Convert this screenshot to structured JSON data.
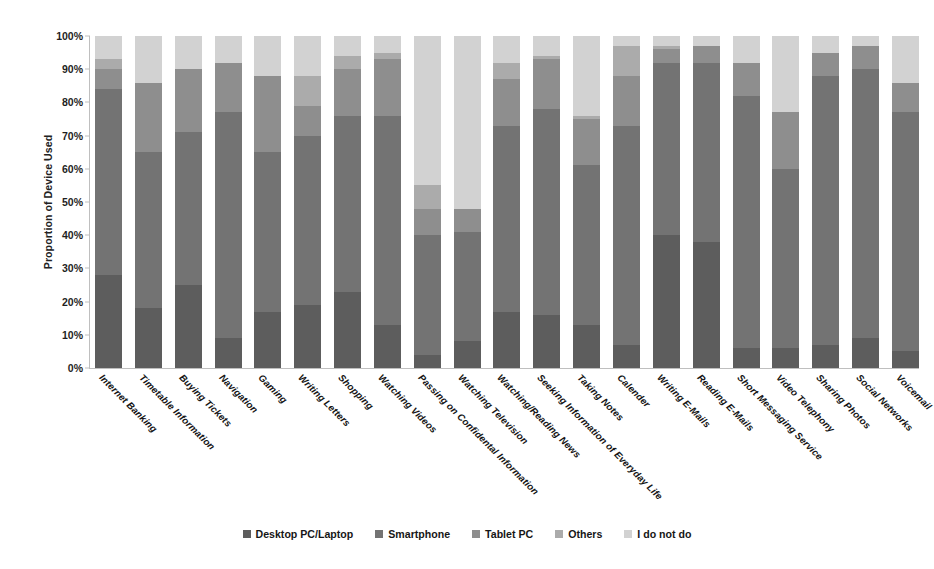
{
  "chart_data": {
    "type": "bar",
    "variant": "stacked-column-100",
    "title": "",
    "xlabel": "",
    "ylabel": "Proportion of Device Used",
    "ylim": [
      0,
      100
    ],
    "ytick_labels": [
      "0%",
      "10%",
      "20%",
      "30%",
      "40%",
      "50%",
      "60%",
      "70%",
      "80%",
      "90%",
      "100%"
    ],
    "ytick_values": [
      0,
      10,
      20,
      30,
      40,
      50,
      60,
      70,
      80,
      90,
      100
    ],
    "grid": false,
    "legend_position": "bottom",
    "categories": [
      "Internet Banking",
      "Timetable Information",
      "Buying Tickets",
      "Navigation",
      "Gaming",
      "Writing Letters",
      "Shopping",
      "Watching Videos",
      "Passing on Confidental Information",
      "Watching Television",
      "Watching/Reading News",
      "Seeking Information of Everyday Life",
      "Taking Notes",
      "Calender",
      "Writing E-Mails",
      "Reading E-Mails",
      "Short Messaging Service",
      "Video Telephony",
      "Sharing Photos",
      "Social Networks",
      "Voicemail"
    ],
    "series": [
      {
        "name": "Desktop PC/Laptop",
        "color": "#5d5d5d",
        "values": [
          28,
          18,
          25,
          9,
          17,
          19,
          23,
          13,
          4,
          8,
          17,
          16,
          13,
          7,
          40,
          38,
          6,
          6,
          7,
          9,
          5
        ]
      },
      {
        "name": "Smartphone",
        "color": "#737373",
        "values": [
          56,
          47,
          46,
          68,
          48,
          51,
          53,
          63,
          36,
          33,
          56,
          62,
          48,
          66,
          52,
          54,
          76,
          54,
          81,
          81,
          72
        ]
      },
      {
        "name": "Tablet PC",
        "color": "#8e8e8e",
        "values": [
          6,
          21,
          19,
          15,
          23,
          9,
          14,
          17,
          8,
          7,
          14,
          15,
          14,
          15,
          4,
          5,
          10,
          17,
          7,
          7,
          9
        ]
      },
      {
        "name": "Others",
        "color": "#ababab",
        "values": [
          3,
          0,
          0,
          0,
          0,
          9,
          4,
          2,
          7,
          0,
          5,
          1,
          1,
          9,
          1,
          0,
          0,
          0,
          0,
          0,
          0
        ]
      },
      {
        "name": "I do not do",
        "color": "#d2d2d2",
        "values": [
          7,
          14,
          10,
          8,
          12,
          12,
          6,
          5,
          45,
          52,
          8,
          6,
          24,
          3,
          3,
          3,
          8,
          23,
          5,
          3,
          14
        ]
      }
    ]
  },
  "legend": {
    "items": [
      {
        "label": "Desktop PC/Laptop",
        "color": "#5d5d5d"
      },
      {
        "label": "Smartphone",
        "color": "#737373"
      },
      {
        "label": "Tablet PC",
        "color": "#8e8e8e"
      },
      {
        "label": "Others",
        "color": "#ababab"
      },
      {
        "label": "I do not do",
        "color": "#d2d2d2"
      }
    ]
  }
}
